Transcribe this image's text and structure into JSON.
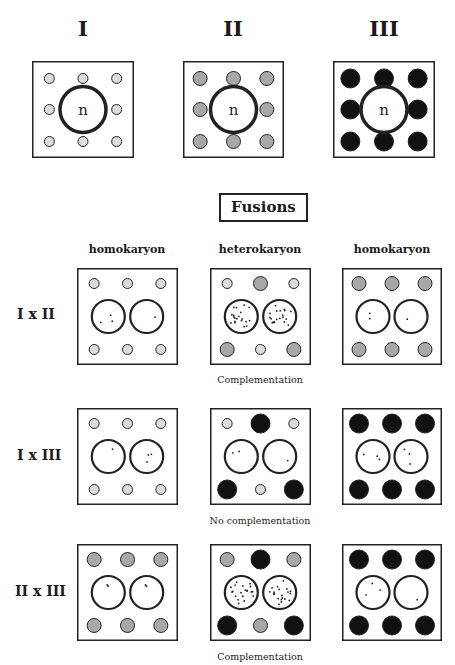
{
  "colors": {
    "cytoplasm_I": "#dcdcdc",
    "cytoplasm_II": "#a8a8a8",
    "cytoplasm_III": "#111111",
    "outline": "#222222"
  },
  "parents": [
    {
      "label": "I",
      "cytoplasm": "I",
      "nucleus_label": "n"
    },
    {
      "label": "II",
      "cytoplasm": "II",
      "nucleus_label": "n"
    },
    {
      "label": "III",
      "cytoplasm": "III",
      "nucleus_label": "n"
    }
  ],
  "fusions": {
    "title": "Fusions",
    "column_headers": [
      "homokaryon",
      "heterokaryon",
      "homokaryon"
    ],
    "rows": [
      {
        "label": "I x II",
        "caption": "Complementation",
        "cells": [
          {
            "type": "homokaryon",
            "organelles": [
              "I",
              "I",
              "I",
              "I",
              "I",
              "I"
            ],
            "nuclei": [
              "sparse",
              "sparse"
            ]
          },
          {
            "type": "heterokaryon",
            "organelles": [
              "I",
              "II",
              "I",
              "II",
              "I",
              "II"
            ],
            "nuclei": [
              "dense",
              "dense"
            ]
          },
          {
            "type": "homokaryon",
            "organelles": [
              "II",
              "II",
              "II",
              "II",
              "II",
              "II"
            ],
            "nuclei": [
              "sparse",
              "sparse"
            ]
          }
        ]
      },
      {
        "label": "I x III",
        "caption": "No complementation",
        "cells": [
          {
            "type": "homokaryon",
            "organelles": [
              "I",
              "I",
              "I",
              "I",
              "I",
              "I"
            ],
            "nuclei": [
              "sparse",
              "sparse"
            ]
          },
          {
            "type": "heterokaryon",
            "organelles": [
              "I",
              "III",
              "I",
              "III",
              "I",
              "III"
            ],
            "nuclei": [
              "sparse",
              "sparse"
            ]
          },
          {
            "type": "homokaryon",
            "organelles": [
              "III",
              "III",
              "III",
              "III",
              "III",
              "III"
            ],
            "nuclei": [
              "sparse",
              "sparse"
            ]
          }
        ]
      },
      {
        "label": "II x III",
        "caption": "Complementation",
        "cells": [
          {
            "type": "homokaryon",
            "organelles": [
              "II",
              "II",
              "II",
              "II",
              "II",
              "II"
            ],
            "nuclei": [
              "sparse",
              "sparse"
            ]
          },
          {
            "type": "heterokaryon",
            "organelles": [
              "II",
              "III",
              "II",
              "III",
              "II",
              "III"
            ],
            "nuclei": [
              "dense",
              "dense"
            ]
          },
          {
            "type": "homokaryon",
            "organelles": [
              "III",
              "III",
              "III",
              "III",
              "III",
              "III"
            ],
            "nuclei": [
              "sparse",
              "sparse"
            ]
          }
        ]
      }
    ]
  }
}
